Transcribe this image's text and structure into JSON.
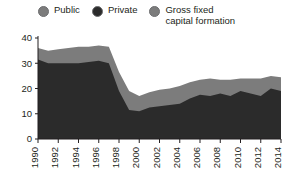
{
  "legend": {
    "items": [
      {
        "label": "Public",
        "color": "#7c7c7c",
        "icon": "circle-swatch-icon"
      },
      {
        "label": "Private",
        "color": "#2b2b2b",
        "icon": "circle-swatch-icon"
      },
      {
        "label": "Gross fixed\ncapital formation",
        "color": "#7c7c7c",
        "icon": "circle-swatch-icon"
      }
    ]
  },
  "chart_data": {
    "type": "area",
    "title": "",
    "subtitle": "",
    "xlabel": "",
    "ylabel": "",
    "stacked": true,
    "grid": false,
    "legend_position": "top",
    "ylim": [
      0,
      40
    ],
    "yticks": [
      0,
      10,
      20,
      30,
      40
    ],
    "xlim": [
      1990,
      2014
    ],
    "xticks": [
      1990,
      1992,
      1994,
      1996,
      1998,
      2000,
      2002,
      2004,
      2006,
      2008,
      2010,
      2012,
      2014
    ],
    "x": [
      1990,
      1991,
      1992,
      1993,
      1994,
      1995,
      1996,
      1997,
      1998,
      1999,
      2000,
      2001,
      2002,
      2003,
      2004,
      2005,
      2006,
      2007,
      2008,
      2009,
      2010,
      2011,
      2012,
      2013,
      2014
    ],
    "series": [
      {
        "name": "Private",
        "color": "#2b2b2b",
        "values": [
          31.5,
          30.0,
          30.0,
          30.0,
          30.0,
          30.5,
          31.0,
          30.0,
          19.0,
          11.5,
          11.0,
          12.5,
          13.0,
          13.5,
          14.0,
          16.0,
          17.5,
          17.0,
          18.0,
          17.0,
          19.0,
          18.0,
          17.0,
          20.0,
          19.0
        ]
      },
      {
        "name": "Public",
        "color": "#7c7c7c",
        "values": [
          4.5,
          5.0,
          5.5,
          6.0,
          6.5,
          6.0,
          6.0,
          6.5,
          7.5,
          7.5,
          6.0,
          6.0,
          6.5,
          6.5,
          7.0,
          6.5,
          6.0,
          7.0,
          5.5,
          6.5,
          5.0,
          6.0,
          7.0,
          5.0,
          5.5
        ]
      }
    ],
    "total_series": {
      "name": "Gross fixed capital formation",
      "values": [
        36.0,
        35.0,
        35.5,
        36.0,
        36.5,
        36.5,
        37.0,
        36.5,
        26.5,
        19.0,
        17.0,
        18.5,
        19.5,
        20.0,
        21.0,
        22.5,
        23.5,
        24.0,
        23.5,
        23.5,
        24.0,
        24.0,
        24.0,
        25.0,
        24.5
      ]
    }
  },
  "axes": {
    "y_tick_labels": [
      "40",
      "30",
      "20",
      "10",
      "0"
    ],
    "x_tick_labels": [
      "1990",
      "1992",
      "1994",
      "1996",
      "1998",
      "2000",
      "2002",
      "2004",
      "2006",
      "2008",
      "2010",
      "2012",
      "2014"
    ]
  }
}
